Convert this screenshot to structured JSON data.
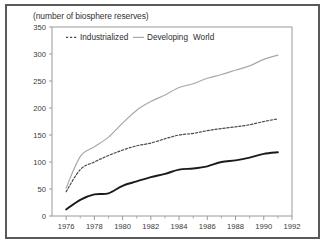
{
  "figure": {
    "title": "(number of biosphere reserves)",
    "frame_color": "#5a5a5a",
    "background": "#ffffff"
  },
  "legend": {
    "position": "top-inside",
    "entries": [
      {
        "label": "Industrialized",
        "style": "dashed",
        "color": "#4a4a4a"
      },
      {
        "label": "Developing",
        "style": "solid",
        "color": "#a8a8a8"
      },
      {
        "label": "World",
        "style": "solid-thick",
        "color": "#1a1a1a"
      }
    ]
  },
  "axes": {
    "y_ticks": [
      "0",
      "50",
      "100",
      "150",
      "200",
      "250",
      "300",
      "350"
    ],
    "x_ticks": [
      "1976",
      "1978",
      "1980",
      "1982",
      "1984",
      "1986",
      "1988",
      "1990",
      "1992"
    ]
  },
  "chart_data": {
    "type": "line",
    "title": "(number of biosphere reserves)",
    "xlabel": "",
    "ylabel": "(number of biosphere reserves)",
    "xlim": [
      1975,
      1992
    ],
    "ylim": [
      0,
      350
    ],
    "ytick_step": 50,
    "xtick_step": 2,
    "x_minor_ticks": true,
    "grid": false,
    "legend_position": "top-inside",
    "x": [
      1976,
      1977,
      1978,
      1979,
      1980,
      1981,
      1982,
      1983,
      1984,
      1985,
      1986,
      1987,
      1988,
      1989,
      1990,
      1991
    ],
    "series": [
      {
        "name": "Industrialized",
        "style": "dashed",
        "color": "#4a4a4a",
        "values": [
          45,
          86,
          100,
          112,
          122,
          130,
          135,
          143,
          150,
          153,
          158,
          162,
          165,
          169,
          175,
          180
        ]
      },
      {
        "name": "Developing",
        "style": "solid",
        "color": "#a8a8a8",
        "values": [
          52,
          110,
          128,
          146,
          172,
          196,
          212,
          224,
          238,
          245,
          255,
          262,
          270,
          278,
          290,
          298
        ]
      },
      {
        "name": "World",
        "style": "solid-thick",
        "color": "#1a1a1a",
        "values": [
          12,
          30,
          40,
          42,
          56,
          64,
          72,
          78,
          86,
          88,
          92,
          100,
          103,
          108,
          115,
          118
        ]
      }
    ]
  }
}
